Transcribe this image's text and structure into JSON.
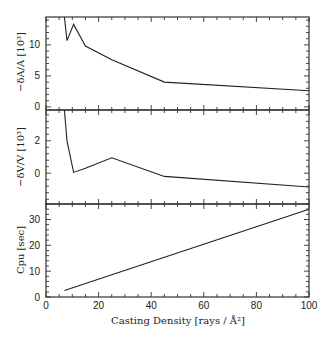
{
  "chart_data": [
    {
      "type": "line",
      "panel": "top",
      "ylabel": "−δA/A [10³]",
      "x": [
        7,
        8,
        10.5,
        15,
        25,
        45,
        100
      ],
      "values": [
        15,
        10.7,
        13.3,
        9.8,
        7.6,
        4.0,
        2.6
      ],
      "ylim": [
        -0.5,
        14.5
      ],
      "yticks": [
        0,
        5,
        10
      ]
    },
    {
      "type": "line",
      "panel": "middle",
      "ylabel": "−δV/V [10³]",
      "x": [
        7,
        8,
        10.5,
        15,
        25,
        45,
        100
      ],
      "values": [
        4.0,
        2.0,
        0.05,
        0.3,
        0.95,
        -0.2,
        -0.85
      ],
      "ylim": [
        -1.9,
        3.9
      ],
      "yticks": [
        0,
        2
      ]
    },
    {
      "type": "line",
      "panel": "bottom",
      "ylabel": "Cpu [sec]",
      "xlabel": "Casting Density [rays / Å²]",
      "x": [
        7,
        100
      ],
      "values": [
        2.5,
        34
      ],
      "ylim": [
        0,
        36
      ],
      "yticks": [
        0,
        10,
        20,
        30
      ],
      "xlim": [
        0,
        100
      ],
      "xticks": [
        0,
        20,
        40,
        60,
        80,
        100
      ]
    }
  ],
  "labels": {
    "top_y": "−δA/A [10³]",
    "mid_y": "−δV/V [10³]",
    "bot_y": "Cpu [sec]",
    "x": "Casting Density [rays / Å²]"
  }
}
